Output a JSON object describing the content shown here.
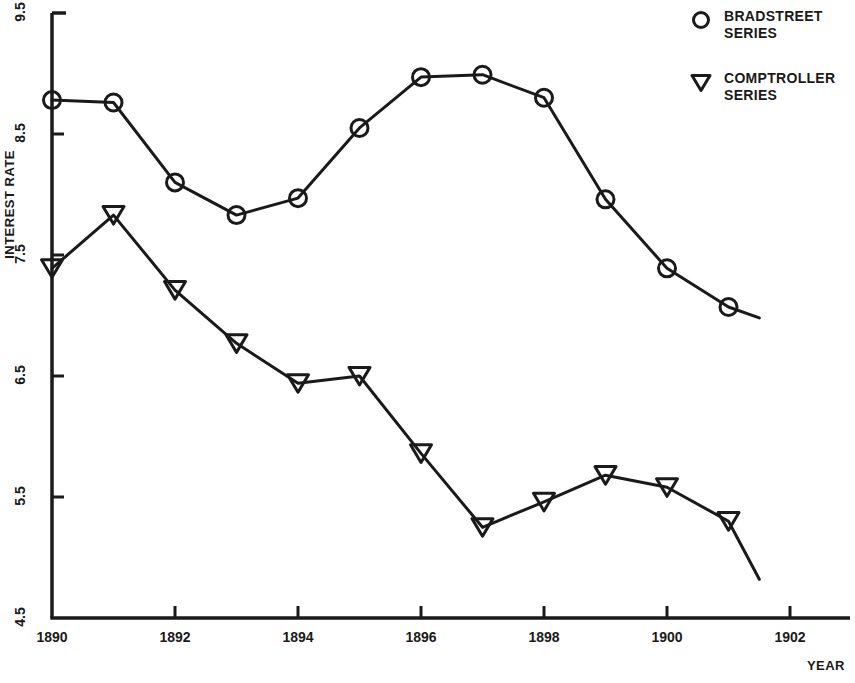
{
  "chart_data": {
    "type": "line",
    "title": "",
    "xlabel": "YEAR",
    "ylabel": "INTEREST RATE",
    "xlim": [
      1889.5,
      1902.6
    ],
    "ylim": [
      4.5,
      9.5
    ],
    "xticks": [
      1890,
      1892,
      1894,
      1896,
      1898,
      1900,
      1902
    ],
    "xtick_labels": [
      "1890",
      "1892",
      "1894",
      "1896",
      "1898",
      "1900",
      "1902"
    ],
    "yticks": [
      4.5,
      5.5,
      6.5,
      7.5,
      8.5,
      9.5
    ],
    "ytick_labels": [
      "4.5",
      "5.5",
      "6.5",
      "7.5",
      "8.5",
      "9.5"
    ],
    "grid": false,
    "legend_position": "top-right",
    "x": [
      1890,
      1891,
      1892,
      1893,
      1894,
      1895,
      1896,
      1897,
      1898,
      1899,
      1900,
      1901
    ],
    "series": [
      {
        "name": "BRADSTREET SERIES",
        "marker": "circle",
        "color": "#1a1a1a",
        "values": [
          8.78,
          8.76,
          8.1,
          7.83,
          7.97,
          8.55,
          8.97,
          8.99,
          8.8,
          7.96,
          7.39,
          7.07
        ],
        "tail": {
          "x": 1901.5,
          "y": 6.98
        }
      },
      {
        "name": "COMPTROLLER SERIES",
        "marker": "triangle-down",
        "color": "#1a1a1a",
        "values": [
          7.39,
          7.83,
          7.21,
          6.77,
          6.44,
          6.5,
          5.86,
          5.25,
          5.46,
          5.68,
          5.58,
          5.3
        ],
        "tail": {
          "x": 1901.5,
          "y": 4.82
        }
      }
    ]
  },
  "legend": {
    "entries": [
      {
        "marker": "circle",
        "label": "BRADSTREET\nSERIES",
        "icon_name": "legend-circle-icon"
      },
      {
        "marker": "triangle-down",
        "label": "COMPTROLLER\nSERIES",
        "icon_name": "legend-triangle-icon"
      }
    ]
  },
  "axes": {
    "y_title": "INTEREST RATE",
    "x_title": "YEAR"
  },
  "colors": {
    "foreground": "#1a1a1a",
    "background": "#ffffff"
  }
}
